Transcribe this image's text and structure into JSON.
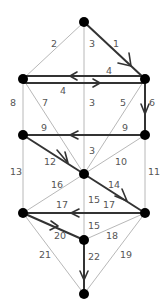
{
  "nodes": [
    {
      "id": "top",
      "x": 84,
      "y": 22
    },
    {
      "id": "L2",
      "x": 23,
      "y": 79
    },
    {
      "id": "R2",
      "x": 145,
      "y": 79
    },
    {
      "id": "L3",
      "x": 23,
      "y": 135
    },
    {
      "id": "R3",
      "x": 145,
      "y": 135
    },
    {
      "id": "C",
      "x": 84,
      "y": 174
    },
    {
      "id": "L5",
      "x": 23,
      "y": 213
    },
    {
      "id": "R5",
      "x": 145,
      "y": 213
    },
    {
      "id": "C2",
      "x": 84,
      "y": 240
    },
    {
      "id": "bottom",
      "x": 84,
      "y": 294
    }
  ],
  "edges": [
    {
      "label": "1",
      "from": "top",
      "to": "R2",
      "bold": true
    },
    {
      "label": "2",
      "from": "top",
      "to": "L2",
      "bold": false
    },
    {
      "label": "3",
      "from": "top",
      "to": "C",
      "bold": false
    },
    {
      "label": "4",
      "from": "R2",
      "to": "L2",
      "bold": true
    },
    {
      "label": "4",
      "from": "L2",
      "to": "R2",
      "bold": true
    },
    {
      "label": "5",
      "from": "R2",
      "to": "C",
      "bold": false
    },
    {
      "label": "6",
      "from": "R2",
      "to": "R3",
      "bold": true
    },
    {
      "label": "7",
      "from": "L2",
      "to": "C",
      "bold": false
    },
    {
      "label": "8",
      "from": "L2",
      "to": "L3",
      "bold": false
    },
    {
      "label": "9",
      "from": "R3",
      "to": "L3",
      "bold": true
    },
    {
      "label": "10",
      "from": "R3",
      "to": "C",
      "bold": false
    },
    {
      "label": "11",
      "from": "R3",
      "to": "R5",
      "bold": false
    },
    {
      "label": "12",
      "from": "L3",
      "to": "C",
      "bold": true
    },
    {
      "label": "13",
      "from": "L3",
      "to": "L5",
      "bold": false
    },
    {
      "label": "14",
      "from": "C",
      "to": "R5",
      "bold": true
    },
    {
      "label": "15",
      "from": "C",
      "to": "C2",
      "bold": false
    },
    {
      "label": "16",
      "from": "C",
      "to": "L5",
      "bold": false
    },
    {
      "label": "17",
      "from": "R5",
      "to": "L5",
      "bold": true
    },
    {
      "label": "18",
      "from": "R5",
      "to": "C2",
      "bold": false
    },
    {
      "label": "19",
      "from": "R5",
      "to": "bottom",
      "bold": false
    },
    {
      "label": "20",
      "from": "L5",
      "to": "C2",
      "bold": true
    },
    {
      "label": "21",
      "from": "L5",
      "to": "bottom",
      "bold": false
    },
    {
      "label": "22",
      "from": "C2",
      "to": "bottom",
      "bold": true
    }
  ],
  "labels": {
    "e1": "1",
    "e2": "2",
    "e3a": "3",
    "e3b": "3",
    "e3c": "3",
    "e4a": "4",
    "e4b": "4",
    "e5": "5",
    "e6": "6",
    "e7": "7",
    "e8": "8",
    "e9a": "9",
    "e9b": "9",
    "e10": "10",
    "e11": "11",
    "e12": "12",
    "e13": "13",
    "e14": "14",
    "e15a": "15",
    "e15b": "15",
    "e15c": "15",
    "e16": "16",
    "e17a": "17",
    "e17b": "17",
    "e18": "18",
    "e19": "19",
    "e20": "20",
    "e21": "21",
    "e22": "22"
  }
}
